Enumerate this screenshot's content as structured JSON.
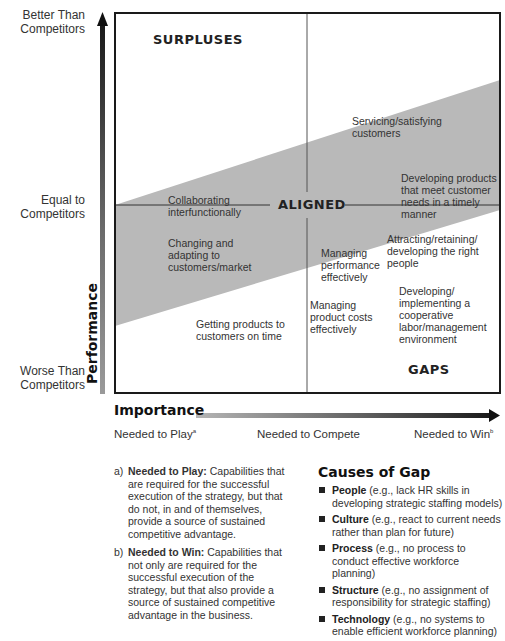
{
  "y_axis": {
    "title": "Performance",
    "ticks": [
      {
        "line1": "Better Than",
        "line2": "Competitors"
      },
      {
        "line1": "Equal to",
        "line2": "Competitors"
      },
      {
        "line1": "Worse Than",
        "line2": "Competitors"
      }
    ]
  },
  "x_axis": {
    "title": "Importance",
    "ticks": [
      {
        "label": "Needed to Play",
        "sup": "a"
      },
      {
        "label": "Needed to Compete",
        "sup": ""
      },
      {
        "label": "Needed to Win",
        "sup": "b"
      }
    ]
  },
  "regions": {
    "surpluses": "SURPLUSES",
    "aligned": "ALIGNED",
    "gaps": "GAPS"
  },
  "items": [
    {
      "id": "servicing",
      "lines": [
        "Servicing/satisfying",
        "customers"
      ]
    },
    {
      "id": "developing-products",
      "lines": [
        "Developing products",
        "that meet customer",
        "needs in a timely",
        "manner"
      ]
    },
    {
      "id": "collaborating",
      "lines": [
        "Collaborating",
        "interfunctionally"
      ]
    },
    {
      "id": "changing",
      "lines": [
        "Changing and",
        "adapting to",
        "customers/market"
      ]
    },
    {
      "id": "managing-performance",
      "lines": [
        "Managing",
        "performance",
        "effectively"
      ]
    },
    {
      "id": "attracting",
      "lines": [
        "Attracting/retaining/",
        "developing the right",
        "people"
      ]
    },
    {
      "id": "getting-products",
      "lines": [
        "Getting products to",
        "customers on time"
      ]
    },
    {
      "id": "managing-costs",
      "lines": [
        "Managing",
        "product costs",
        "effectively"
      ]
    },
    {
      "id": "labor-management",
      "lines": [
        "Developing/",
        "implementing a",
        "cooperative",
        "labor/management",
        "environment"
      ]
    }
  ],
  "notes": [
    {
      "tag": "a)",
      "term": "Needed to Play:",
      "text": "Capabilities that are required for the successful execution of the strategy, but that do not, in and of themselves, provide a source of sustained competitive advantage."
    },
    {
      "tag": "b)",
      "term": "Needed to Win:",
      "text": "Capabilities that not only are required for the successful execution of the strategy, but that also provide a source of sustained competitive advantage in the business."
    }
  ],
  "causes": {
    "title": "Causes of Gap",
    "items": [
      {
        "term": "People",
        "text": "(e.g., lack HR skills in developing strategic staffing models)"
      },
      {
        "term": "Culture",
        "text": "(e.g., react to current needs rather than plan for future)"
      },
      {
        "term": "Process",
        "text": "(e.g., no process to conduct effective workforce planning)"
      },
      {
        "term": "Structure",
        "text": "(e.g., no assignment of responsibility for strategic staffing)"
      },
      {
        "term": "Technology",
        "text": "(e.g., no systems to enable efficient workforce planning)"
      }
    ]
  },
  "colors": {
    "band": "#b9b9b9",
    "frame": "#1a1a1a",
    "divider": "#555555"
  }
}
